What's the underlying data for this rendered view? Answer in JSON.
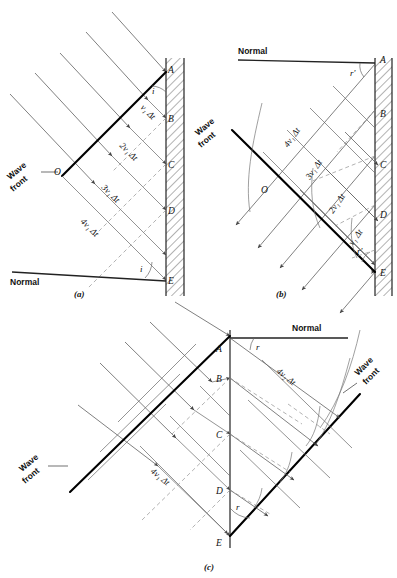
{
  "figure": {
    "panels": [
      {
        "id": "a",
        "caption": "(a)",
        "description": "Incident plane wavefront striking a reflecting surface at angle of incidence i",
        "normal_label": "Normal",
        "wavefront_label_line1": "Wave",
        "wavefront_label_line2": "front",
        "angle_labels": [
          "i",
          "i"
        ],
        "surface_points": [
          "A",
          "B",
          "C",
          "D",
          "E"
        ],
        "origin_point": "O",
        "distance_labels": [
          "v₁ Δt",
          "2v₁ Δt",
          "3v₁ Δt",
          "4v₁ Δt"
        ]
      },
      {
        "id": "b",
        "caption": "(b)",
        "description": "Reflected wavelets forming the reflected wavefront at angle r'",
        "normal_label": "Normal",
        "wavefront_label_line1": "Wave",
        "wavefront_label_line2": "front",
        "angle_labels": [
          "r'",
          "r'"
        ],
        "surface_points": [
          "A",
          "B",
          "C",
          "D",
          "E"
        ],
        "origin_point": "O",
        "distance_labels": [
          "4v₁ Δt",
          "3v₁ Δt",
          "2v₁ Δt",
          "v₁ Δt"
        ]
      },
      {
        "id": "c",
        "caption": "(c)",
        "description": "Refracted wavelets in the second medium forming the refracted wavefront at angle r",
        "normal_label": "Normal",
        "wavefront_label_incident_line1": "Wave",
        "wavefront_label_incident_line2": "front",
        "wavefront_label_refracted_line1": "Wave",
        "wavefront_label_refracted_line2": "front",
        "angle_labels": [
          "r",
          "r"
        ],
        "surface_points": [
          "A",
          "B",
          "C",
          "D",
          "E"
        ],
        "distance_label_medium1": "4v₁ Δt",
        "distance_label_medium2": "4v₂ Δt"
      }
    ],
    "colors": {
      "ink": "#111111",
      "ray": "#555555",
      "wavefront": "#000000",
      "dashed_wavelet": "#888888",
      "wall_hatch": "#444444",
      "background": "#ffffff"
    }
  }
}
